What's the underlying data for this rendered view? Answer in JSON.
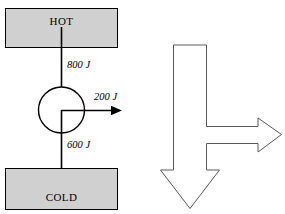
{
  "diagram": {
    "type": "schematic",
    "colors": {
      "reservoir_fill": "#d0d0d0",
      "reservoir_stroke": "#000000",
      "engine_fill": "#ffffff",
      "engine_stroke": "#000000",
      "flow_stroke": "#000000",
      "outline_arrow_fill": "#ffffff",
      "outline_arrow_stroke": "#5a5a5a",
      "background": "#ffffff"
    },
    "left_panel": {
      "hot_reservoir": {
        "label": "HOT",
        "shape": "rectangle"
      },
      "cold_reservoir": {
        "label": "COLD",
        "shape": "rectangle"
      },
      "engine": {
        "label": "",
        "shape": "circle"
      },
      "flows": [
        {
          "name": "heat-input",
          "label": "800 J",
          "direction": "down",
          "from": "HOT",
          "to": "engine"
        },
        {
          "name": "work-output",
          "label": "200 J",
          "direction": "right",
          "from": "engine",
          "to": "surroundings"
        },
        {
          "name": "heat-rejected",
          "label": "600 J",
          "direction": "down",
          "from": "engine",
          "to": "COLD"
        }
      ]
    },
    "right_panel": {
      "name": "energy-flow-outline-arrow",
      "description": "Outline block arrow splitting downward and rightward",
      "branches": [
        {
          "name": "main-down-branch",
          "direction": "down"
        },
        {
          "name": "side-right-branch",
          "direction": "right"
        }
      ]
    }
  }
}
